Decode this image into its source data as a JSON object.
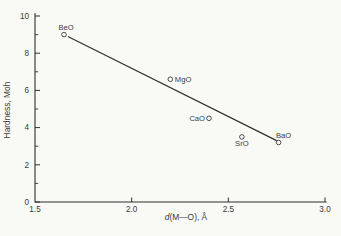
{
  "figure": {
    "background": "#f9f9f6",
    "ink": "#3a3a3a",
    "line_color": "#2f2f2f"
  },
  "chart_data": {
    "type": "scatter",
    "title": "",
    "xlabel": "d(M—O), Å",
    "xlabel_italic_prefix": "d",
    "xlabel_rest": "(M—O), Å",
    "ylabel": "Hardness, Moh",
    "xlim": [
      1.5,
      3.0
    ],
    "ylim": [
      0,
      10
    ],
    "x_tick_values": [
      1.5,
      2.0,
      2.5,
      3.0
    ],
    "x_tick_labels": [
      "1.5",
      "2.0",
      "2.5",
      "3.0"
    ],
    "y_tick_values": [
      0,
      2,
      4,
      6,
      8,
      10
    ],
    "y_tick_labels": [
      "0",
      "2",
      "4",
      "6",
      "8",
      "10"
    ],
    "y_minor_tick_values": [
      1,
      3,
      5,
      7,
      9
    ],
    "grid": false,
    "legend": "none",
    "marker": "open-circle",
    "points": [
      {
        "label": "BeO",
        "x": 1.65,
        "y": 9.0,
        "label_side": "above"
      },
      {
        "label": "MgO",
        "x": 2.2,
        "y": 6.6,
        "label_side": "right"
      },
      {
        "label": "CaO",
        "x": 2.4,
        "y": 4.5,
        "label_side": "left"
      },
      {
        "label": "SrO",
        "x": 2.57,
        "y": 3.5,
        "label_side": "below"
      },
      {
        "label": "BaO",
        "x": 2.76,
        "y": 3.2,
        "label_side": "above-right"
      }
    ],
    "trendline": {
      "x1": 1.67,
      "y1": 8.9,
      "x2": 2.75,
      "y2": 3.3
    }
  }
}
